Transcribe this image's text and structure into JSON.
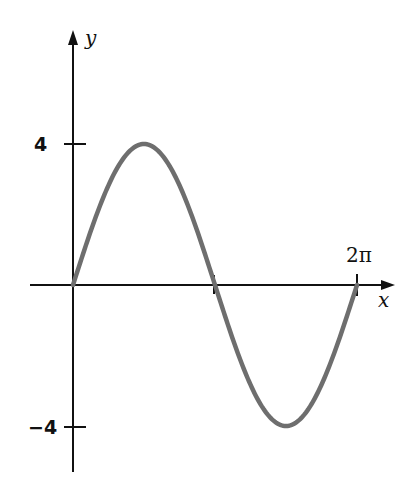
{
  "chart_data": {
    "type": "line",
    "title": "",
    "xlabel": "x",
    "ylabel": "y",
    "function": "y = 4 sin x",
    "xlim": [
      0,
      6.2832
    ],
    "ylim": [
      -4,
      4
    ],
    "x_ticks": [
      {
        "value": 3.1416,
        "label": ""
      },
      {
        "value": 6.2832,
        "label": "2π"
      }
    ],
    "y_ticks": [
      {
        "value": 4,
        "label": "4"
      },
      {
        "value": -4,
        "label": "−4"
      }
    ],
    "grid": false,
    "legend": null,
    "series": [
      {
        "name": "4 sin x",
        "color": "#6e6e6e",
        "x": [
          0,
          0.7854,
          1.5708,
          2.3562,
          3.1416,
          3.927,
          4.7124,
          5.4978,
          6.2832
        ],
        "y": [
          0,
          2.83,
          4,
          2.83,
          0,
          -2.83,
          -4,
          -2.83,
          0
        ]
      }
    ]
  },
  "labels": {
    "x_axis": "x",
    "y_axis": "y",
    "y_top": "4",
    "y_bottom": "−4",
    "x_end": "2π"
  }
}
